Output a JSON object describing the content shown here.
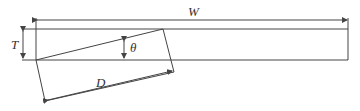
{
  "labels": {
    "width": "W",
    "thickness": "T",
    "angle": "θ",
    "diagonal": "D"
  },
  "colors": {
    "line": "#444444",
    "text": "#333333"
  }
}
